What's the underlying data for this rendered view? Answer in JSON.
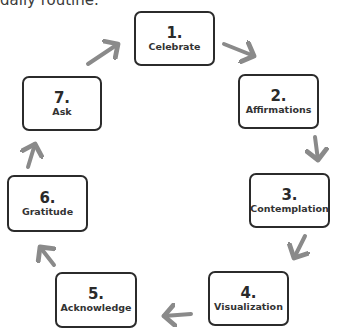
{
  "caption": "daily routine.",
  "cycle": {
    "steps": [
      {
        "number": "1.",
        "label": "Celebrate"
      },
      {
        "number": "2.",
        "label": "Affirmations"
      },
      {
        "number": "3.",
        "label": "Contemplation"
      },
      {
        "number": "4.",
        "label": "Visualization"
      },
      {
        "number": "5.",
        "label": "Acknowledge"
      },
      {
        "number": "6.",
        "label": "Gratitude"
      },
      {
        "number": "7.",
        "label": "Ask"
      }
    ],
    "arrow_color": "#8a8a8a",
    "border_color": "#2b2b2b"
  }
}
